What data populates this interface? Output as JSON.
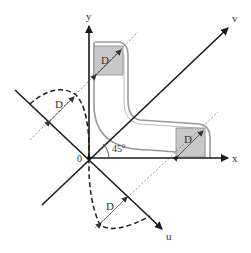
{
  "diagram": {
    "type": "coordinate-rotation-diagram",
    "axes": {
      "x": {
        "label": "x"
      },
      "y": {
        "label": "y"
      },
      "u": {
        "label": "u"
      },
      "v": {
        "label": "v"
      }
    },
    "origin": {
      "label": "0"
    },
    "angle": {
      "value": "45",
      "unit": "0"
    },
    "squares": [
      {
        "label": "D",
        "position": "top (on y arm)"
      },
      {
        "label": "D",
        "position": "right (on x arm)"
      }
    ],
    "dashed_profiles": [
      {
        "label": "D",
        "position": "upper-left (on u axis extension)"
      },
      {
        "label": "D",
        "position": "lower (on u axis)"
      }
    ],
    "colors": {
      "axis": "#1a1a1a",
      "square_fill": "#c8c8c8",
      "outline": "#999999",
      "dashed": "#1a1a1a",
      "dotted_diagonal": "#666666"
    }
  }
}
